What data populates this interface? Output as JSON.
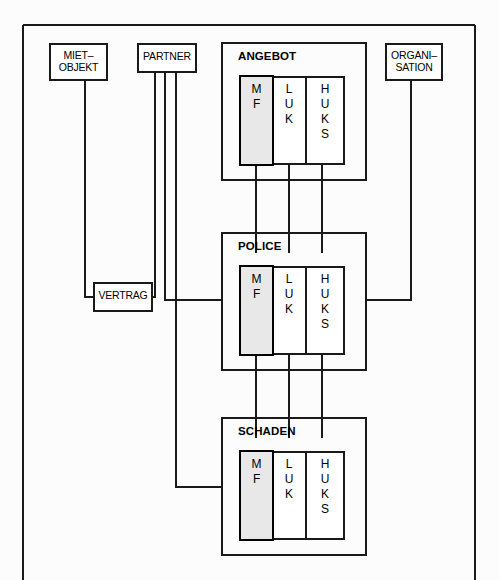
{
  "diagram": {
    "frame": {
      "name": "outer-frame",
      "stroke": "#1a1a1a"
    },
    "colors": {
      "line": "#1a1a1a",
      "box_fill": "#ffffff",
      "highlight_fill": "#e8e8e8",
      "text": "#000000"
    },
    "entities": [
      {
        "id": "miet-objekt",
        "label": "MIET–\nOBJEKT",
        "x": 50,
        "y": 44,
        "w": 57,
        "h": 36
      },
      {
        "id": "partner",
        "label": "PARTNER",
        "x": 138,
        "y": 44,
        "w": 58,
        "h": 28
      },
      {
        "id": "organisation",
        "label": "ORGANI–\nSATION",
        "x": 386,
        "y": 44,
        "w": 56,
        "h": 36
      },
      {
        "id": "vertrag",
        "label": "VERTRAG",
        "x": 94,
        "y": 283,
        "w": 58,
        "h": 28
      }
    ],
    "groups": [
      {
        "id": "angebot",
        "title": "ANGEBOT",
        "x": 222,
        "y": 43,
        "w": 144,
        "h": 137,
        "columns": [
          {
            "id": "mf",
            "label": "M\nF",
            "highlight": true
          },
          {
            "id": "luk",
            "label": "L\nU\nK",
            "highlight": false
          },
          {
            "id": "huks",
            "label": "H\nU\nK\nS",
            "highlight": false
          }
        ]
      },
      {
        "id": "police",
        "title": "POLICE",
        "x": 222,
        "y": 233,
        "w": 144,
        "h": 137,
        "columns": [
          {
            "id": "mf",
            "label": "M\nF",
            "highlight": true
          },
          {
            "id": "luk",
            "label": "L\nU\nK",
            "highlight": false
          },
          {
            "id": "huks",
            "label": "H\nU\nK\nS",
            "highlight": false
          }
        ]
      },
      {
        "id": "schaden",
        "title": "SCHADEN",
        "x": 222,
        "y": 418,
        "w": 144,
        "h": 137,
        "columns": [
          {
            "id": "mf",
            "label": "M\nF",
            "highlight": true
          },
          {
            "id": "luk",
            "label": "L\nU\nK",
            "highlight": false
          },
          {
            "id": "huks",
            "label": "H\nU\nK\nS",
            "highlight": false
          }
        ]
      }
    ]
  }
}
